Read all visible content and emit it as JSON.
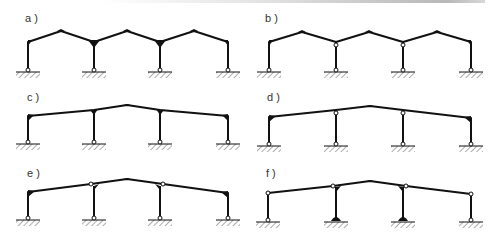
{
  "figure": {
    "colors": {
      "line": "#111111",
      "hinge_fill": "#ffffff",
      "hatch": "#777777",
      "topbar": "#b8b8b8"
    },
    "panels": [
      {
        "id": "a",
        "label": "a )",
        "roof": "sawtooth-gable",
        "bays": 3,
        "supports": [
          "pinned",
          "pinned",
          "pinned",
          "pinned"
        ],
        "column_tops": [
          "rigid",
          "rigid",
          "rigid",
          "rigid"
        ]
      },
      {
        "id": "b",
        "label": "b )",
        "roof": "sawtooth-gable",
        "bays": 3,
        "supports": [
          "pinned",
          "pinned",
          "pinned",
          "pinned"
        ],
        "column_tops": [
          "rigid",
          "hinged",
          "hinged",
          "rigid"
        ]
      },
      {
        "id": "c",
        "label": "c )",
        "roof": "single-gable",
        "bays": 3,
        "supports": [
          "pinned",
          "pinned",
          "pinned",
          "pinned"
        ],
        "column_tops": [
          "rigid",
          "rigid",
          "rigid",
          "rigid"
        ]
      },
      {
        "id": "d",
        "label": "d )",
        "roof": "single-gable",
        "bays": 3,
        "supports": [
          "pinned",
          "pinned",
          "pinned",
          "pinned"
        ],
        "column_tops": [
          "rigid",
          "hinged",
          "hinged",
          "rigid"
        ]
      },
      {
        "id": "e",
        "label": "e )",
        "roof": "single-gable",
        "bays": 3,
        "supports": [
          "pinned",
          "pinned",
          "pinned",
          "pinned"
        ],
        "column_tops": [
          "rigid",
          "hinged-beam",
          "hinged-beam",
          "rigid"
        ]
      },
      {
        "id": "f",
        "label": "f )",
        "roof": "single-gable",
        "bays": 3,
        "supports": [
          "pinned",
          "fixed",
          "fixed",
          "pinned"
        ],
        "column_tops": [
          "hinged",
          "hinged-beam",
          "hinged-beam",
          "hinged"
        ]
      }
    ]
  }
}
